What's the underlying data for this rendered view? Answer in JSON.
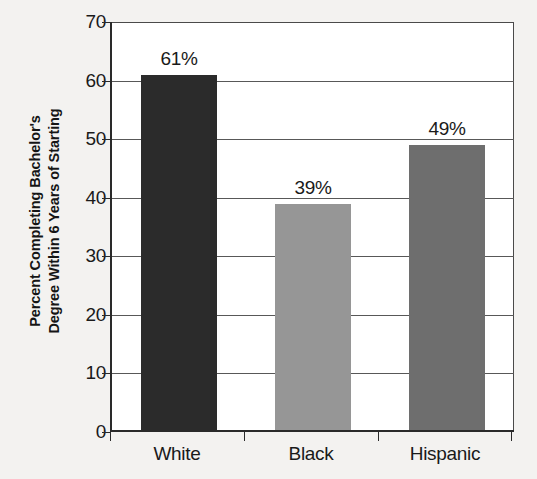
{
  "chart_data": {
    "type": "bar",
    "title": "",
    "subtitle": "",
    "xlabel": "",
    "ylabel_line1": "Percent Completing Bachelor's",
    "ylabel_line2": "Degree Within 6 Years of Starting",
    "categories": [
      "White",
      "Black",
      "Hispanic"
    ],
    "values": [
      61,
      39,
      49
    ],
    "data_labels": [
      "61%",
      "39%",
      "49%"
    ],
    "bar_colors": [
      "#2b2b2b",
      "#969696",
      "#6e6e6e"
    ],
    "ylim": [
      0,
      70
    ],
    "ytick_values": [
      0,
      10,
      20,
      30,
      40,
      50,
      60,
      70
    ],
    "ytick_labels": [
      "0",
      "10",
      "20",
      "30",
      "40",
      "50",
      "60",
      "70"
    ],
    "grid": true,
    "legend": "none",
    "legend_position": "none",
    "background_color": "#f3f2f0",
    "plot_background_color": "#ffffff",
    "axis_color": "#2a2a2a"
  }
}
